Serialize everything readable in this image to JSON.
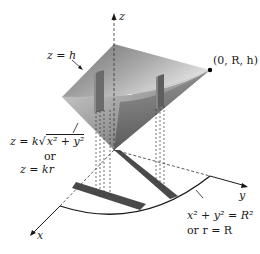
{
  "diagram": {
    "type": "3d-cone-in-cylindrical-coordinates",
    "axes": {
      "z": "z",
      "y": "y",
      "x": "x"
    },
    "labels": {
      "top_plane": "z = h",
      "point": "(0, R, h)",
      "cone_eq_line1_prefix": "z = k",
      "cone_eq_line1_sqrt": "x² + y²",
      "cone_eq_or": "or",
      "cone_eq_line2": "z = kr",
      "circle_eq_line1": "x² + y² = R²",
      "circle_eq_line2": "or r = R"
    },
    "colors": {
      "cone_dark": "#5a5a5a",
      "cone_light": "#e0e0e0",
      "shadow_band": "#4a4a4a",
      "line": "#1a1a1a"
    }
  }
}
